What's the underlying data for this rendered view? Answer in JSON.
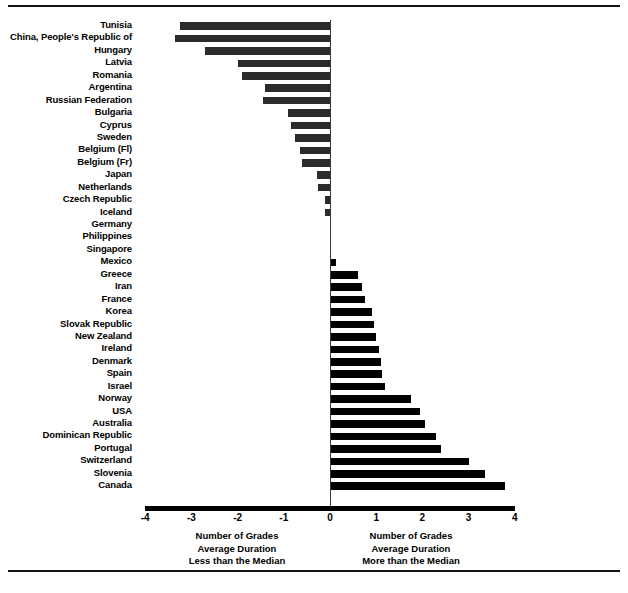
{
  "chart_data": {
    "type": "bar",
    "orientation": "horizontal",
    "title": "",
    "xlabel": "Number of Grades Average Duration",
    "ylabel": "",
    "xlim": [
      -4,
      4
    ],
    "xticks": [
      "-4",
      "-3",
      "-2",
      "-1",
      "0",
      "1",
      "2",
      "3",
      "4"
    ],
    "grid": false,
    "legend": "none",
    "zero_reference": 0,
    "categories": [
      "Tunisia",
      "China, People's Republic of",
      "Hungary",
      "Latvia",
      "Romania",
      "Argentina",
      "Russian Federation",
      "Bulgaria",
      "Cyprus",
      "Sweden",
      "Belgium (Fl)",
      "Belgium (Fr)",
      "Japan",
      "Netherlands",
      "Czech Republic",
      "Iceland",
      "Germany",
      "Philippines",
      "Singapore",
      "Mexico",
      "Greece",
      "Iran",
      "France",
      "Korea",
      "Slovak Republic",
      "New Zealand",
      "Ireland",
      "Denmark",
      "Spain",
      "Israel",
      "Norway",
      "USA",
      "Australia",
      "Dominican Republic",
      "Portugal",
      "Switzerland",
      "Slovenia",
      "Canada"
    ],
    "values": [
      -3.25,
      -3.35,
      -2.7,
      -2.0,
      -1.9,
      -1.4,
      -1.45,
      -0.9,
      -0.85,
      -0.75,
      -0.65,
      -0.6,
      -0.28,
      -0.25,
      -0.1,
      -0.1,
      0.0,
      0.0,
      0.0,
      0.12,
      0.6,
      0.7,
      0.75,
      0.9,
      0.95,
      1.0,
      1.05,
      1.1,
      1.12,
      1.2,
      1.75,
      1.95,
      2.05,
      2.3,
      2.4,
      3.0,
      3.35,
      3.78
    ]
  },
  "axis": {
    "ticks": [
      {
        "label": "-4",
        "value": -4
      },
      {
        "label": "-3",
        "value": -3
      },
      {
        "label": "-2",
        "value": -2
      },
      {
        "label": "-1",
        "value": -1
      },
      {
        "label": "0",
        "value": 0
      },
      {
        "label": "1",
        "value": 1
      },
      {
        "label": "2",
        "value": 2
      },
      {
        "label": "3",
        "value": 3
      },
      {
        "label": "4",
        "value": 4
      }
    ]
  },
  "captions": {
    "left": {
      "line1": "Number of Grades",
      "line2": "Average Duration",
      "line3": "Less than the Median"
    },
    "right": {
      "line1": "Number of Grades",
      "line2": "Average Duration",
      "line3": "More than the Median"
    }
  },
  "colors": {
    "negative_bar": "#2b2b2b",
    "positive_bar": "#000000",
    "rule": "#111111",
    "zero_line": "#3a3a3a"
  }
}
